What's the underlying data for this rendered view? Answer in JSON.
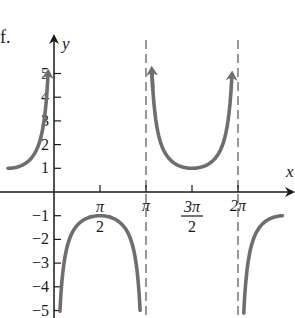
{
  "panel_label": "f.",
  "colors": {
    "curve": "#6e6e6e",
    "axis": "#1a1a1a",
    "asymptote": "#555555",
    "background": "#ffffff"
  },
  "chart_data": {
    "type": "line",
    "title": "",
    "function": "y = -csc x",
    "xlabel": "x",
    "ylabel": "y",
    "x_ticks": [
      {
        "value": 1.5708,
        "label_num": "π",
        "label_den": "2"
      },
      {
        "value": 3.1416,
        "label": "π"
      },
      {
        "value": 4.7124,
        "label_num": "3π",
        "label_den": "2"
      },
      {
        "value": 6.2832,
        "label": "2π"
      }
    ],
    "y_ticks": [
      {
        "value": 5,
        "label": "5"
      },
      {
        "value": 4,
        "label": "4"
      },
      {
        "value": 3,
        "label": "3"
      },
      {
        "value": 2,
        "label": "2"
      },
      {
        "value": 1,
        "label": "1"
      },
      {
        "value": -1,
        "label": "−1"
      },
      {
        "value": -2,
        "label": "−2"
      },
      {
        "value": -3,
        "label": "−3"
      },
      {
        "value": -4,
        "label": "−4"
      },
      {
        "value": -5,
        "label": "−5"
      }
    ],
    "asymptotes_x": [
      3.1416,
      6.2832
    ],
    "xlim": [
      -1.6,
      7.8
    ],
    "ylim": [
      -5.5,
      6.2
    ],
    "grid": false,
    "series": [
      {
        "name": "branch-left",
        "x": [
          -1.57,
          -1.2,
          -0.8,
          -0.5,
          -0.3,
          -0.2
        ],
        "values": [
          1.0,
          1.07,
          1.39,
          2.09,
          3.38,
          5.03
        ],
        "arrow_end": true
      },
      {
        "name": "branch-1",
        "x": [
          0.2,
          0.3,
          0.5,
          0.8,
          1.2,
          1.5708,
          1.94,
          2.34,
          2.64,
          2.84,
          2.94
        ],
        "values": [
          -5.03,
          -3.38,
          -2.09,
          -1.39,
          -1.07,
          -1.0,
          -1.07,
          -1.39,
          -2.09,
          -3.38,
          -5.03
        ]
      },
      {
        "name": "branch-2",
        "x": [
          3.34,
          3.44,
          3.64,
          3.94,
          4.34,
          4.7124,
          5.08,
          5.48,
          5.78,
          5.98,
          6.08
        ],
        "values": [
          5.03,
          3.38,
          2.09,
          1.39,
          1.07,
          1.0,
          1.07,
          1.39,
          2.09,
          3.38,
          5.03
        ],
        "arrow_start": true,
        "arrow_end": true
      },
      {
        "name": "branch-3",
        "x": [
          6.48,
          6.58,
          6.78,
          7.08,
          7.48,
          7.8
        ],
        "values": [
          -5.03,
          -3.38,
          -2.09,
          -1.39,
          -1.07,
          -1.0
        ]
      }
    ]
  }
}
